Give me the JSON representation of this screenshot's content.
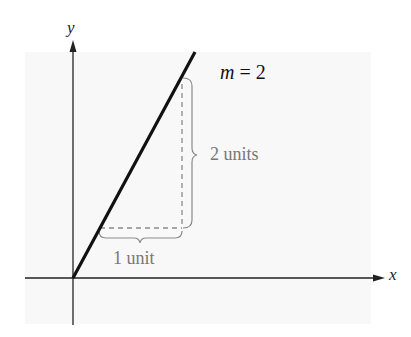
{
  "diagram": {
    "axes": {
      "x_label": "x",
      "y_label": "y"
    },
    "line": {
      "slope_var": "m",
      "slope_eq": " = 2",
      "color": "#111111"
    },
    "annotations": {
      "rise_label": "2 units",
      "run_label": "1 unit",
      "guide_color": "#8a8a8a"
    }
  }
}
